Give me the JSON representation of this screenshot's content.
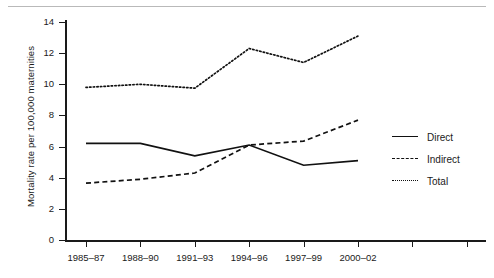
{
  "chart_data": {
    "type": "line",
    "title": "",
    "xlabel": "",
    "ylabel": "Mortality rate per 100,000 maternities",
    "categories": [
      "1985–87",
      "1988–90",
      "1991–93",
      "1994–96",
      "1997–99",
      "2000–02"
    ],
    "series": [
      {
        "name": "Direct",
        "style": "solid",
        "values": [
          6.2,
          6.2,
          5.4,
          6.1,
          4.8,
          5.1
        ]
      },
      {
        "name": "Indirect",
        "style": "dashed",
        "values": [
          3.65,
          3.9,
          4.3,
          6.1,
          6.35,
          7.7
        ]
      },
      {
        "name": "Total",
        "style": "dotted",
        "values": [
          9.8,
          10.0,
          9.75,
          12.3,
          11.4,
          13.1
        ]
      }
    ],
    "ylim": [
      0,
      14
    ],
    "yticks": [
      0,
      2,
      4,
      6,
      8,
      10,
      12,
      14
    ],
    "ytick_labels": [
      "0",
      "2",
      "4",
      "6",
      "8",
      "10",
      "12",
      "14"
    ],
    "grid": false,
    "legend_position": "right"
  },
  "legend": {
    "items": [
      {
        "label": "Direct",
        "swatch": "solid-line-icon"
      },
      {
        "label": "Indirect",
        "swatch": "dashed-line-icon"
      },
      {
        "label": "Total",
        "swatch": "dotted-line-icon"
      }
    ]
  }
}
